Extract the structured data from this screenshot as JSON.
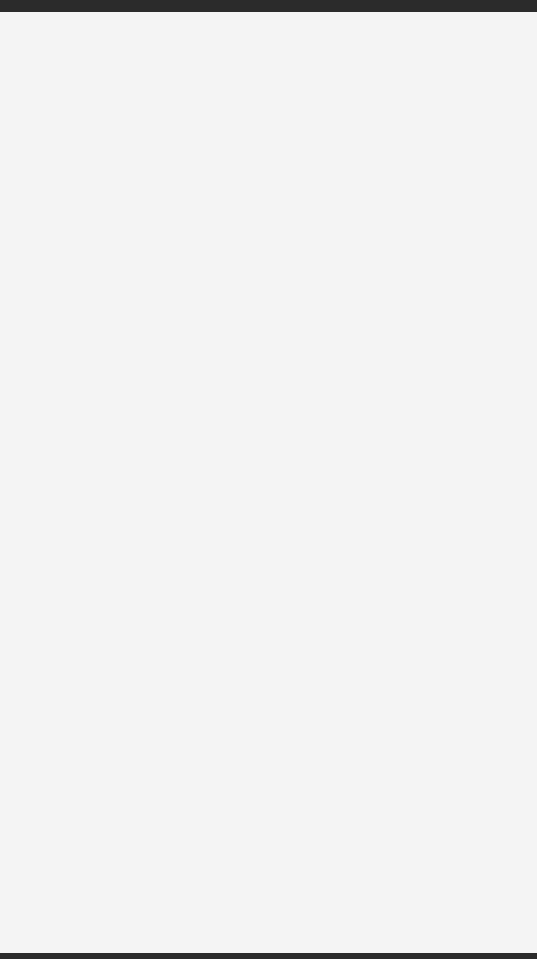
{
  "worksheet": {
    "description": "Domino dot-counting worksheet",
    "colors": {
      "ink": "#262626",
      "dot": "#222222",
      "paper": "#ffffff"
    },
    "rows": [
      {
        "dominoes": [
          {
            "left": 0,
            "right": 0
          },
          {
            "left": 0,
            "right": 1
          }
        ]
      },
      {
        "dominoes": [
          {
            "left": 0,
            "right": 2
          },
          {
            "left": 0,
            "right": 3
          }
        ]
      },
      {
        "dominoes": [
          {
            "left": 0,
            "right": 4
          },
          {
            "left": 0,
            "right": 5
          }
        ]
      },
      {
        "dominoes": [
          {
            "left": 0,
            "right": 6
          },
          {
            "left": 1,
            "right": 1
          }
        ]
      },
      {
        "dominoes": [
          {
            "left": 1,
            "right": 2
          },
          {
            "left": 1,
            "right": 3
          }
        ]
      },
      {
        "dominoes": [
          {
            "left": 1,
            "right": 4
          },
          {
            "left": 1,
            "right": 5
          }
        ]
      },
      {
        "dominoes": [
          {
            "left": 1,
            "right": 6
          },
          {
            "left": 2,
            "right": 2
          }
        ]
      }
    ]
  }
}
